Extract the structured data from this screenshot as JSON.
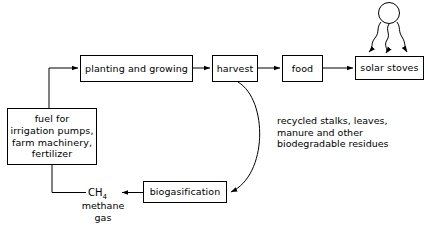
{
  "diagram": {
    "background": "#ffffff",
    "line_color": "#000000",
    "nodes": {
      "planting": "planting and growing",
      "harvest": "harvest",
      "food": "food",
      "solar_stoves": "solar stoves",
      "biogasification": "biogasification",
      "fuel": {
        "line1": "fuel for",
        "line2": "irrigation pumps,",
        "line3": "farm machinery,",
        "line4": "fertilizer"
      }
    },
    "labels": {
      "recycled": {
        "line1": "recycled stalks, leaves,",
        "line2": "manure and other",
        "line3": "biodegradable residues"
      },
      "methane_formula": "CH",
      "methane_subscript": "4",
      "methane_name_line1": "methane",
      "methane_name_line2": "gas"
    },
    "icons": {
      "sun": "sun-icon",
      "rays": "sun-rays-icon"
    }
  }
}
